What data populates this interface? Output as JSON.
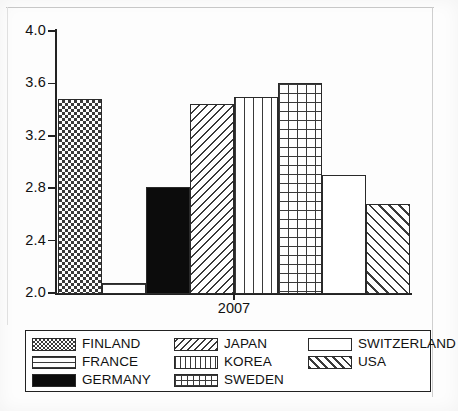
{
  "chart_data": {
    "type": "bar",
    "title": "",
    "xlabel": "",
    "ylabel": "",
    "categories": [
      "2007"
    ],
    "xtick_labels": [
      "2007"
    ],
    "ylim": [
      2.0,
      4.0
    ],
    "ytick_labels": [
      "4.0",
      "3.6",
      "3.2",
      "2.8",
      "2.4",
      "2.0"
    ],
    "ytick_values": [
      4.0,
      3.6,
      3.2,
      2.8,
      2.4,
      2.0
    ],
    "grid": false,
    "legend_position": "below-plot",
    "series": [
      {
        "name": "FINLAND",
        "values": [
          3.48
        ],
        "pattern": "checker"
      },
      {
        "name": "FRANCE",
        "values": [
          2.08
        ],
        "pattern": "horizontal-lines"
      },
      {
        "name": "GERMANY",
        "values": [
          2.81
        ],
        "pattern": "solid-black"
      },
      {
        "name": "JAPAN",
        "values": [
          3.44
        ],
        "pattern": "backslash-hatch"
      },
      {
        "name": "KOREA",
        "values": [
          3.5
        ],
        "pattern": "vertical-lines"
      },
      {
        "name": "SWEDEN",
        "values": [
          3.6
        ],
        "pattern": "grid"
      },
      {
        "name": "SWITZERLAND",
        "values": [
          2.9
        ],
        "pattern": "blank-white"
      },
      {
        "name": "USA",
        "values": [
          2.68
        ],
        "pattern": "forward-slash-hatch"
      }
    ]
  },
  "axes": {
    "y_ticks": [
      {
        "label": "4.0",
        "value": 4.0
      },
      {
        "label": "3.6",
        "value": 3.6
      },
      {
        "label": "3.2",
        "value": 3.2
      },
      {
        "label": "2.8",
        "value": 2.8
      },
      {
        "label": "2.4",
        "value": 2.4
      },
      {
        "label": "2.0",
        "value": 2.0
      }
    ],
    "x_ticks": [
      {
        "label": "2007"
      }
    ]
  },
  "legend": {
    "entries": [
      {
        "label": "FINLAND",
        "pattern": "checker"
      },
      {
        "label": "JAPAN",
        "pattern": "backslash-hatch"
      },
      {
        "label": "SWITZERLAND",
        "pattern": "blank-white"
      },
      {
        "label": "FRANCE",
        "pattern": "horizontal-lines"
      },
      {
        "label": "KOREA",
        "pattern": "vertical-lines"
      },
      {
        "label": "USA",
        "pattern": "forward-slash-hatch"
      },
      {
        "label": "GERMANY",
        "pattern": "solid-black"
      },
      {
        "label": "SWEDEN",
        "pattern": "grid"
      }
    ]
  },
  "colors": {
    "ink": "#222222",
    "pattern_ink": "#3a3a3a",
    "fill": "#ffffff",
    "solid_fill": "#0c0c0c",
    "page": "#fdfdfd"
  }
}
